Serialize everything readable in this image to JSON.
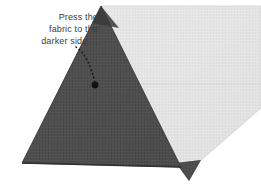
{
  "figure": {
    "caption_lines": [
      "Press the",
      "fabric to the",
      "darker side ..."
    ],
    "caption_text": "Press the\nfabric to the\ndarker side ...",
    "background_color": "#ffffff",
    "text_color": "#3c3c3c"
  },
  "shapes": {
    "dark_fabric": {
      "label": "darker side fabric triangle",
      "color": "#4f4f4f",
      "shade_color": "#3b3b3b",
      "edge_color": "#2e2e2e",
      "points": "101,6 181,167 22,163"
    },
    "dark_fabric_shadow_wedge": {
      "label": "dark fold shadow wedge",
      "color": "#3a3a3a",
      "points": "101,6 118,27 93,22"
    },
    "dark_tab": {
      "label": "dark fabric tab under fold",
      "color": "#4a4a4a",
      "points": "176,163 201,161 189,181"
    },
    "light_fabric": {
      "label": "lighter side fabric",
      "color": "#e3e3e3",
      "shade_color": "#d9d9d9",
      "edge_color": "#cccccc",
      "points": "101,6 261,6 261,108 199,162 176,163"
    },
    "fold_crease": {
      "label": "center fold crease line",
      "color": "#c2c2c2"
    }
  },
  "leader": {
    "label": "dotted leader line to press point",
    "dot_color": "#111111",
    "line_color": "#1a1a1a",
    "dots_path": "M 76,47 C 84,52 90,63 95,84",
    "dash_tail": "… trailing dots after text",
    "target_dot": {
      "cx": 95,
      "cy": 85,
      "r": 3.4
    }
  }
}
